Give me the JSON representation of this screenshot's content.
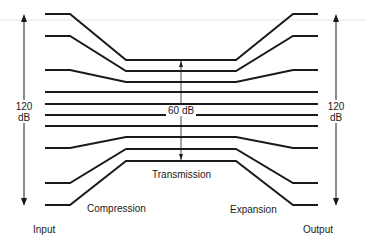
{
  "diagram": {
    "left_scale": {
      "value": "120",
      "unit": "dB"
    },
    "right_scale": {
      "value": "120",
      "unit": "dB"
    },
    "center_range": "60 dB",
    "labels": {
      "transmission": "Transmission",
      "compression": "Compression",
      "expansion": "Expansion",
      "input": "Input",
      "output": "Output"
    },
    "signal_lines": [
      {
        "id": "line-1",
        "points": [
          [
            45,
            14
          ],
          [
            70,
            14
          ],
          [
            126,
            60
          ],
          [
            236,
            60
          ],
          [
            293,
            14
          ],
          [
            318,
            14
          ]
        ]
      },
      {
        "id": "line-2",
        "points": [
          [
            45,
            36
          ],
          [
            70,
            36
          ],
          [
            126,
            71
          ],
          [
            236,
            71
          ],
          [
            293,
            36
          ],
          [
            318,
            36
          ]
        ]
      },
      {
        "id": "line-3",
        "points": [
          [
            45,
            70
          ],
          [
            70,
            70
          ],
          [
            126,
            82
          ],
          [
            236,
            82
          ],
          [
            293,
            70
          ],
          [
            318,
            70
          ]
        ]
      },
      {
        "id": "line-4",
        "points": [
          [
            45,
            92
          ],
          [
            318,
            92
          ]
        ]
      },
      {
        "id": "line-5",
        "points": [
          [
            45,
            104
          ],
          [
            318,
            104
          ]
        ]
      },
      {
        "id": "line-6",
        "points": [
          [
            45,
            115
          ],
          [
            318,
            115
          ]
        ]
      },
      {
        "id": "line-7",
        "points": [
          [
            45,
            126
          ],
          [
            318,
            126
          ]
        ]
      },
      {
        "id": "line-8",
        "points": [
          [
            45,
            148
          ],
          [
            70,
            148
          ],
          [
            126,
            137
          ],
          [
            236,
            137
          ],
          [
            293,
            148
          ],
          [
            318,
            148
          ]
        ]
      },
      {
        "id": "line-9",
        "points": [
          [
            45,
            183
          ],
          [
            70,
            183
          ],
          [
            126,
            149
          ],
          [
            236,
            149
          ],
          [
            293,
            183
          ],
          [
            318,
            183
          ]
        ]
      },
      {
        "id": "line-10",
        "points": [
          [
            45,
            205
          ],
          [
            70,
            205
          ],
          [
            126,
            161
          ],
          [
            236,
            161
          ],
          [
            293,
            205
          ],
          [
            318,
            205
          ]
        ]
      }
    ],
    "colors": {
      "line": "#1a1a1a",
      "background": "#ffffff"
    }
  }
}
